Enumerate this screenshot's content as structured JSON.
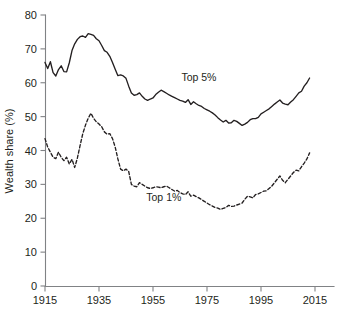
{
  "chart_data": {
    "type": "line",
    "title": "",
    "xlabel": "",
    "ylabel": "Wealth share (%)",
    "xlim": [
      1915,
      2013
    ],
    "ylim": [
      0,
      80
    ],
    "grid": false,
    "legend_position": "inline-annotations",
    "x_ticks": [
      "1915",
      "1935",
      "1955",
      "1975",
      "1995",
      "2015"
    ],
    "x_tick_values": [
      1915,
      1935,
      1955,
      1975,
      1995,
      2015
    ],
    "y_ticks": [
      "0",
      "10",
      "20",
      "30",
      "40",
      "50",
      "60",
      "70",
      "80"
    ],
    "y_tick_values": [
      0,
      10,
      20,
      30,
      40,
      50,
      60,
      70,
      80
    ],
    "annotations": [
      {
        "text": "Top 5%",
        "x": 1972,
        "y": 60.5
      },
      {
        "text": "Top 1%",
        "x": 1959,
        "y": 25.0
      }
    ],
    "series": [
      {
        "name": "Top 5%",
        "style": "solid",
        "color": "#231f20",
        "x": [
          1915,
          1916,
          1917,
          1918,
          1919,
          1920,
          1921,
          1922,
          1923,
          1924,
          1925,
          1926,
          1927,
          1928,
          1929,
          1930,
          1931,
          1932,
          1933,
          1934,
          1935,
          1936,
          1937,
          1938,
          1939,
          1940,
          1941,
          1942,
          1943,
          1944,
          1945,
          1946,
          1947,
          1948,
          1949,
          1950,
          1951,
          1952,
          1953,
          1954,
          1955,
          1956,
          1957,
          1958,
          1959,
          1960,
          1961,
          1962,
          1963,
          1964,
          1965,
          1966,
          1967,
          1968,
          1969,
          1970,
          1971,
          1972,
          1973,
          1974,
          1975,
          1976,
          1977,
          1978,
          1979,
          1980,
          1981,
          1982,
          1983,
          1984,
          1985,
          1986,
          1987,
          1988,
          1989,
          1990,
          1991,
          1992,
          1993,
          1994,
          1995,
          1996,
          1997,
          1998,
          1999,
          2000,
          2001,
          2002,
          2003,
          2004,
          2005,
          2006,
          2007,
          2008,
          2009,
          2010,
          2011,
          2012,
          2013
        ],
        "values": [
          66.0,
          64.2,
          66.2,
          63.0,
          62.0,
          63.9,
          65.0,
          63.3,
          63.2,
          65.9,
          69.5,
          71.5,
          72.8,
          73.6,
          73.8,
          73.4,
          74.5,
          74.3,
          74.0,
          73.0,
          72.4,
          71.0,
          69.5,
          69.0,
          67.8,
          66.0,
          64.0,
          62.1,
          62.3,
          62.0,
          61.3,
          59.0,
          57.0,
          56.3,
          56.5,
          57.0,
          56.0,
          55.2,
          54.8,
          55.2,
          55.5,
          56.5,
          57.2,
          57.8,
          57.4,
          56.9,
          56.4,
          56.0,
          55.6,
          55.2,
          54.8,
          54.6,
          54.2,
          55.0,
          53.6,
          54.4,
          53.8,
          53.3,
          53.0,
          52.4,
          52.0,
          51.6,
          51.1,
          50.5,
          49.7,
          49.0,
          48.4,
          48.9,
          48.1,
          48.2,
          48.9,
          48.6,
          48.0,
          47.4,
          47.8,
          48.3,
          49.1,
          49.4,
          49.4,
          49.8,
          50.8,
          51.3,
          51.8,
          52.3,
          53.0,
          53.7,
          54.3,
          54.9,
          54.0,
          53.7,
          53.5,
          54.3,
          55.0,
          56.0,
          57.0,
          57.5,
          59.0,
          60.0,
          61.4
        ]
      },
      {
        "name": "Top 1%",
        "style": "dashed",
        "color": "#231f20",
        "x": [
          1915,
          1916,
          1917,
          1918,
          1919,
          1920,
          1921,
          1922,
          1923,
          1924,
          1925,
          1926,
          1927,
          1928,
          1929,
          1930,
          1931,
          1932,
          1933,
          1934,
          1935,
          1936,
          1937,
          1938,
          1939,
          1940,
          1941,
          1942,
          1943,
          1944,
          1945,
          1946,
          1947,
          1948,
          1949,
          1950,
          1951,
          1952,
          1953,
          1954,
          1955,
          1956,
          1957,
          1958,
          1959,
          1960,
          1961,
          1962,
          1963,
          1964,
          1965,
          1966,
          1967,
          1968,
          1969,
          1970,
          1971,
          1972,
          1973,
          1974,
          1975,
          1976,
          1977,
          1978,
          1979,
          1980,
          1981,
          1982,
          1983,
          1984,
          1985,
          1986,
          1987,
          1988,
          1989,
          1990,
          1991,
          1992,
          1993,
          1994,
          1995,
          1996,
          1997,
          1998,
          1999,
          2000,
          2001,
          2002,
          2003,
          2004,
          2005,
          2006,
          2007,
          2008,
          2009,
          2010,
          2011,
          2012,
          2013
        ],
        "values": [
          43.5,
          41.0,
          39.5,
          38.0,
          37.6,
          39.5,
          38.0,
          37.0,
          38.0,
          36.0,
          37.4,
          35.0,
          37.8,
          41.5,
          45.0,
          47.5,
          49.5,
          51.0,
          49.5,
          48.5,
          47.8,
          47.0,
          45.5,
          44.8,
          45.0,
          43.5,
          41.0,
          37.5,
          34.5,
          34.0,
          34.5,
          33.8,
          30.0,
          29.5,
          29.3,
          30.5,
          30.0,
          29.5,
          29.0,
          28.8,
          29.0,
          29.3,
          29.2,
          29.0,
          29.3,
          29.5,
          29.0,
          28.5,
          28.0,
          28.2,
          27.6,
          27.2,
          27.0,
          27.8,
          26.5,
          26.8,
          26.4,
          26.0,
          25.5,
          25.0,
          24.5,
          24.0,
          23.6,
          23.2,
          23.0,
          22.6,
          22.9,
          23.2,
          23.8,
          23.5,
          23.6,
          23.9,
          24.2,
          24.5,
          25.6,
          26.5,
          26.3,
          26.0,
          27.0,
          27.2,
          27.6,
          28.0,
          28.1,
          28.8,
          29.5,
          30.5,
          31.5,
          32.5,
          31.2,
          30.5,
          31.5,
          32.5,
          33.5,
          34.2,
          34.0,
          35.2,
          36.3,
          37.5,
          39.3
        ]
      }
    ]
  },
  "figure": {
    "ylabel": "Wealth share (%)"
  }
}
